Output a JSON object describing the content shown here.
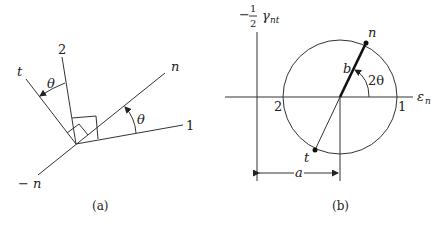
{
  "figure_a": {
    "caption": "(a)",
    "labels": {
      "axis_2": "2",
      "axis_t": "t",
      "axis_n": "n",
      "axis_1": "1",
      "axis_neg_n": "− n",
      "theta_upper": "θ",
      "theta_lower": "θ"
    }
  },
  "figure_b": {
    "caption": "(b)",
    "labels": {
      "y_axis_prefix": "−",
      "y_axis_num": "1",
      "y_axis_den": "2",
      "y_axis_symbol": "γ",
      "y_axis_sub": "nt",
      "x_axis_symbol": "ε",
      "x_axis_sub": "n",
      "point_n": "n",
      "point_t": "t",
      "point_1": "1",
      "point_2": "2",
      "radius_b": "b",
      "angle_2theta": "2θ",
      "dim_a": "a"
    }
  },
  "colors": {
    "line": "#333333",
    "text": "#222222",
    "background": "#ffffff"
  }
}
